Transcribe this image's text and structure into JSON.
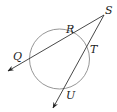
{
  "diagram": {
    "type": "circle-with-two-secants",
    "colors": {
      "circle": "#8a8a8a",
      "lines": "#333333",
      "labels": "#222222"
    },
    "circle": {
      "cx": 59.5,
      "cy": 59,
      "r": 30
    },
    "external_point": {
      "name": "S",
      "x": 104,
      "y": 15
    },
    "secants": [
      {
        "name": "secant-SQ",
        "from": "S",
        "through": [
          "R",
          "Q"
        ],
        "tip": {
          "x": 8,
          "y": 71
        }
      },
      {
        "name": "secant-SU",
        "from": "S",
        "through": [
          "T",
          "U"
        ],
        "tip": {
          "x": 53,
          "y": 108
        }
      }
    ],
    "labels": {
      "S": "S",
      "R": "R",
      "Q": "Q",
      "T": "T",
      "U": "U"
    }
  }
}
